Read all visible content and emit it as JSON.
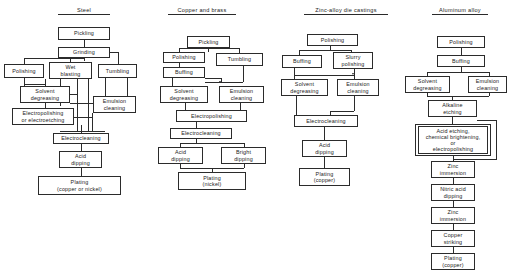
{
  "figure": {
    "type": "process-flow-diagram",
    "columns": [
      {
        "id": "steel",
        "title": "Steel",
        "nodes": [
          {
            "id": "s1",
            "label": "Pickling"
          },
          {
            "id": "s2",
            "label": "Grinding"
          },
          {
            "id": "s3",
            "label": "Polishing"
          },
          {
            "id": "s4",
            "label": "Wet\nblasting"
          },
          {
            "id": "s5",
            "label": "Tumbling"
          },
          {
            "id": "s6",
            "label": "Solvent\ndegreasing"
          },
          {
            "id": "s7",
            "label": "Emulsion\ncleaning"
          },
          {
            "id": "s8",
            "label": "Electropolishing\nor electroetching"
          },
          {
            "id": "s9",
            "label": "Electrocleaning"
          },
          {
            "id": "s10",
            "label": "Acid\ndipping"
          },
          {
            "id": "s11",
            "label": "Plating\n(copper or nickel)"
          }
        ]
      },
      {
        "id": "copper-brass",
        "title": "Copper and brass",
        "nodes": [
          {
            "id": "c1",
            "label": "Pickling"
          },
          {
            "id": "c2",
            "label": "Polishing"
          },
          {
            "id": "c3",
            "label": "Tumbling"
          },
          {
            "id": "c4",
            "label": "Buffing"
          },
          {
            "id": "c5",
            "label": "Solvent\ndegreasing"
          },
          {
            "id": "c6",
            "label": "Emulsion\ncleaning"
          },
          {
            "id": "c7",
            "label": "Electropolishing"
          },
          {
            "id": "c8",
            "label": "Electrocleaning"
          },
          {
            "id": "c9",
            "label": "Acid\ndipping"
          },
          {
            "id": "c10",
            "label": "Bright\ndipping"
          },
          {
            "id": "c11",
            "label": "Plating\n(nickel)"
          }
        ]
      },
      {
        "id": "zinc-alloy-die-castings",
        "title": "Zinc-alloy die castings",
        "nodes": [
          {
            "id": "z1",
            "label": "Polishing"
          },
          {
            "id": "z2",
            "label": "Buffing"
          },
          {
            "id": "z3",
            "label": "Slurry\npolishing"
          },
          {
            "id": "z4",
            "label": "Solvent\ndegreasing"
          },
          {
            "id": "z5",
            "label": "Emulsion\ncleaning"
          },
          {
            "id": "z6",
            "label": "Electrocleaning"
          },
          {
            "id": "z7",
            "label": "Acid\ndipping"
          },
          {
            "id": "z8",
            "label": "Plating\n(copper)"
          }
        ]
      },
      {
        "id": "aluminum-alloy",
        "title": "Aluminum alloy",
        "nodes": [
          {
            "id": "a1",
            "label": "Polishing"
          },
          {
            "id": "a2",
            "label": "Buffing"
          },
          {
            "id": "a3",
            "label": "Solvent\ndegreasing"
          },
          {
            "id": "a4",
            "label": "Emulsion\ncleaning"
          },
          {
            "id": "a5",
            "label": "Alkaline\netching"
          },
          {
            "id": "a6",
            "label": "Acid  etching,\nchemical brightening,\nor\nelectropolishing"
          },
          {
            "id": "a7",
            "label": "Zinc\nimmersion"
          },
          {
            "id": "a8",
            "label": "Nitric acid\ndipping"
          },
          {
            "id": "a9",
            "label": "Zinc\nimmersion"
          },
          {
            "id": "a10",
            "label": "Copper\nstriking"
          },
          {
            "id": "a11",
            "label": "Plating\n(copper)"
          }
        ]
      }
    ]
  },
  "style": {
    "background": "#ffffff",
    "line_color": "#2b2b2b",
    "text_color": "#1a1a1a"
  }
}
